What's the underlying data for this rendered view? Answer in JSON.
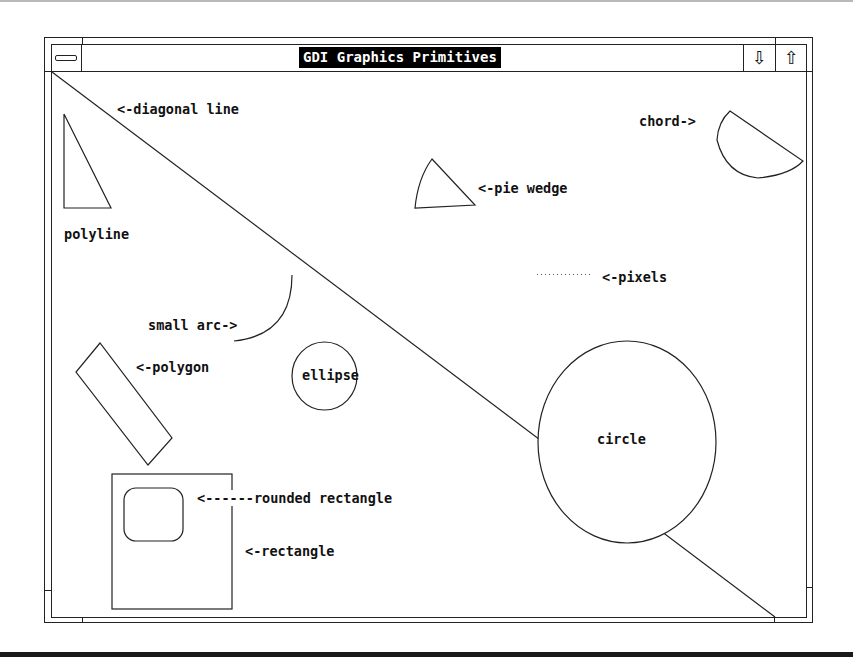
{
  "window": {
    "title": "GDI Graphics Primitives",
    "system_menu_icon": "system-menu-bar-icon",
    "minimize_icon": "⇩",
    "maximize_icon": "⇧"
  },
  "labels": {
    "diagonal_line": "<-diagonal line",
    "polyline": "polyline",
    "pie_wedge": "<-pie wedge",
    "chord": "chord->",
    "pixels": "<-pixels",
    "small_arc": "small arc->",
    "polygon": "<-polygon",
    "ellipse": "ellipse",
    "circle": "circle",
    "rounded_rectangle": "<------rounded rectangle",
    "rectangle": "<-rectangle"
  },
  "colors": {
    "stroke": "#222222",
    "title_bg": "#000000",
    "title_fg": "#ffffff",
    "background": "#ffffff"
  }
}
